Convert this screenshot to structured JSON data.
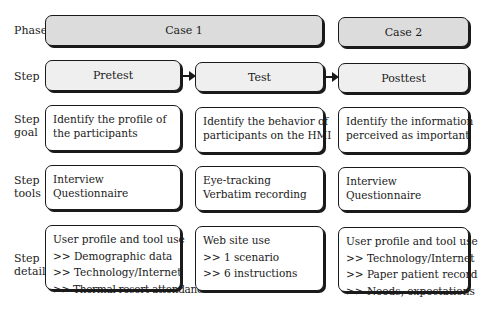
{
  "row_labels": {
    "phase": "Phase",
    "step": "Step",
    "step_goal": [
      "Step",
      "goal"
    ],
    "step_tools": [
      "Step",
      "tools"
    ],
    "step_detail": [
      "Step",
      "detail"
    ]
  },
  "phases": [
    {
      "label": "Case 1"
    },
    {
      "label": "Case 2"
    }
  ],
  "steps": [
    {
      "label": "Pretest"
    },
    {
      "label": "Test"
    },
    {
      "label": "Posttest"
    }
  ],
  "goals": [
    {
      "lines": [
        "Identify the profile of",
        "the participants"
      ]
    },
    {
      "lines": [
        "Identify the behavior of",
        "participants on the HMI"
      ]
    },
    {
      "lines": [
        "Identify the information",
        "perceived as important"
      ]
    }
  ],
  "tools": [
    {
      "lines": [
        "Interview",
        "Questionnaire"
      ]
    },
    {
      "lines": [
        "Eye-tracking",
        "Verbatim recording"
      ]
    },
    {
      "lines": [
        "Interview",
        "Questionnaire"
      ]
    }
  ],
  "details": [
    {
      "lines": [
        "User profile and tool use",
        ">> Demographic data",
        ">> Technology/Internet",
        ">> Thermal resort attendance"
      ]
    },
    {
      "lines": [
        "Web site use",
        ">> 1 scenario",
        ">> 6 instructions"
      ]
    },
    {
      "lines": [
        "User profile and tool use",
        ">> Technology/Internet",
        ">> Paper patient record",
        ">> Needs, expectations"
      ]
    }
  ],
  "colors": {
    "phase_fill": "#dcdcdc",
    "step_fill": "#efefef",
    "border": "#1a1a1a"
  }
}
